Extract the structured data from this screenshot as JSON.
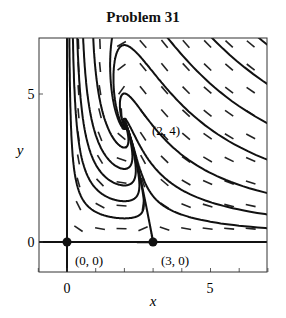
{
  "chart_data": {
    "type": "phase-portrait",
    "title": "Problem 31",
    "xlabel": "x",
    "ylabel": "y",
    "xlim": [
      -1,
      7
    ],
    "ylim": [
      -0.95,
      6.9
    ],
    "xticks": [
      0,
      5
    ],
    "yticks": [
      0,
      5
    ],
    "grid": false,
    "legend": null,
    "equilibria": [
      {
        "x": 0,
        "y": 0,
        "label": "(0, 0)",
        "marker": "filled"
      },
      {
        "x": 3,
        "y": 0,
        "label": "(3, 0)",
        "marker": "filled"
      },
      {
        "x": 2,
        "y": 4,
        "label": "(2, 4)",
        "marker": "spiral-sink"
      }
    ],
    "nullclines_shown": [
      "x = 0",
      "y = 0"
    ],
    "direction_field": "dashed-arrows",
    "annotations": [
      "(0, 0)",
      "(3, 0)",
      "(2, 4)"
    ]
  },
  "labels": {
    "title": "Problem 31",
    "x_axis": "x",
    "y_axis": "y",
    "x_tick_0": "0",
    "x_tick_5": "5",
    "y_tick_0": "0",
    "y_tick_5": "5",
    "eq_origin": "(0, 0)",
    "eq_x3": "(3, 0)",
    "eq_spiral": "(2, 4)"
  }
}
